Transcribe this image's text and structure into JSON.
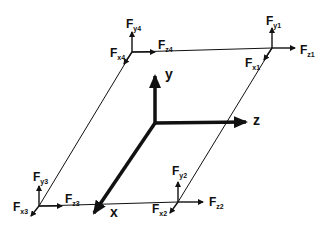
{
  "diagram": {
    "type": "3D force diagram on a parallelogram plate",
    "axes": {
      "x": "x",
      "y": "y",
      "z": "z"
    },
    "corners": [
      {
        "id": 1,
        "position": "top-right",
        "labels": {
          "y": {
            "main": "F",
            "sub": "y1"
          },
          "z": {
            "main": "F",
            "sub": "z1"
          },
          "x": {
            "main": "F",
            "sub": "x1"
          }
        }
      },
      {
        "id": 2,
        "position": "bottom-right",
        "labels": {
          "y": {
            "main": "F",
            "sub": "y2"
          },
          "z": {
            "main": "F",
            "sub": "z2"
          },
          "x": {
            "main": "F",
            "sub": "x2"
          }
        }
      },
      {
        "id": 3,
        "position": "bottom-left",
        "labels": {
          "y": {
            "main": "F",
            "sub": "y3"
          },
          "z": {
            "main": "F",
            "sub": "z3"
          },
          "x": {
            "main": "F",
            "sub": "x3"
          }
        }
      },
      {
        "id": 4,
        "position": "top-left",
        "labels": {
          "y": {
            "main": "F",
            "sub": "y4"
          },
          "z": {
            "main": "F",
            "sub": "z4"
          },
          "x": {
            "main": "F",
            "sub": "x4"
          }
        }
      }
    ],
    "colors": {
      "line": "#111111",
      "background": "#ffffff"
    }
  }
}
